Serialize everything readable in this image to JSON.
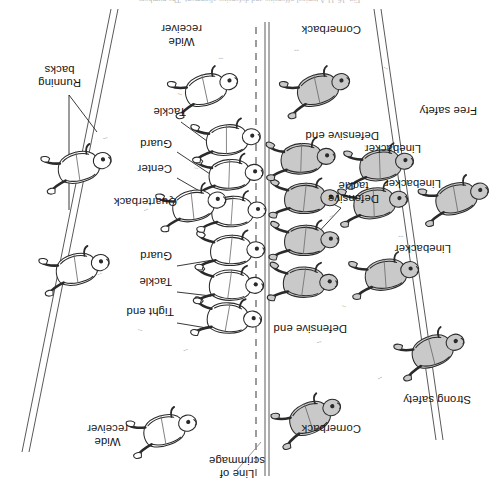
{
  "figure": {
    "caption": "Fig. 16-11  A typical offensive and defensive alignment. The numbers",
    "orientation_note": "printed upside-down (rotated 180 degrees)",
    "line_of_scrimmage_label": "Line of\nscrimmage"
  },
  "field": {
    "background_color": "#ffffff",
    "line_color": "#595959",
    "scrimmage_style": "dashed",
    "sideline_style": "double-solid-diagonal"
  },
  "colors": {
    "defense_fill": "#c9c9c9",
    "offense_fill": "#ffffff",
    "outline": "#2a2a2a",
    "leader_line": "#222222",
    "label_text": "#141414",
    "grass": "#9a9a9a"
  },
  "defense": {
    "side_label": "Defense",
    "labels": [
      {
        "id": "cornerback-top",
        "text": "Cornerback",
        "x": 138,
        "y": 65
      },
      {
        "id": "strong-safety",
        "text": "Strong safety",
        "x": 28,
        "y": 94
      },
      {
        "id": "defensive-end-up",
        "text": "Defensive end",
        "x": 152,
        "y": 165
      },
      {
        "id": "linebacker-1",
        "text": "Linebacker",
        "x": 48,
        "y": 245
      },
      {
        "id": "defensive-tackle",
        "text": "Defensive\ntackle",
        "x": 120,
        "y": 295
      },
      {
        "id": "linebacker-2",
        "text": "Linebacker",
        "x": 58,
        "y": 310
      },
      {
        "id": "linebacker-3",
        "text": "Linebacker",
        "x": 78,
        "y": 345
      },
      {
        "id": "defensive-end-dn",
        "text": "Defensive end",
        "x": 120,
        "y": 358
      },
      {
        "id": "free-safety",
        "text": "Free safety",
        "x": 22,
        "y": 383
      },
      {
        "id": "cornerback-bot",
        "text": "Cornerback",
        "x": 138,
        "y": 464
      }
    ],
    "players": [
      {
        "id": "cornerback-top",
        "x": 185,
        "y": 96,
        "rot": -22,
        "shaded": true
      },
      {
        "id": "strong-safety",
        "x": 63,
        "y": 160,
        "rot": -18,
        "shaded": true
      },
      {
        "id": "linebacker-outer",
        "x": 112,
        "y": 230,
        "rot": -8,
        "shaded": true
      },
      {
        "id": "defensive-end-1",
        "x": 198,
        "y": 215,
        "rot": 4,
        "shaded": true
      },
      {
        "id": "defensive-tackle-1",
        "x": 196,
        "y": 258,
        "rot": 2,
        "shaded": true
      },
      {
        "id": "defensive-tackle-2",
        "x": 196,
        "y": 300,
        "rot": 2,
        "shaded": true
      },
      {
        "id": "defensive-end-2",
        "x": 198,
        "y": 342,
        "rot": -2,
        "shaded": true
      },
      {
        "id": "linebacker-mid",
        "x": 124,
        "y": 300,
        "rot": -6,
        "shaded": true
      },
      {
        "id": "linebacker-low",
        "x": 118,
        "y": 338,
        "rot": -6,
        "shaded": true
      },
      {
        "id": "free-safety",
        "x": 40,
        "y": 310,
        "rot": -14,
        "shaded": true
      },
      {
        "id": "cornerback-bot",
        "x": 178,
        "y": 420,
        "rot": -16,
        "shaded": true
      }
    ]
  },
  "offense": {
    "side_label": "Offense",
    "labels": [
      {
        "id": "wide-receiver-top",
        "text": "Wide\nreceiver",
        "x": 371,
        "y": 52
      },
      {
        "id": "tight-end",
        "text": "Tight end",
        "x": 325,
        "y": 182
      },
      {
        "id": "tackle-top",
        "text": "Tackle",
        "x": 327,
        "y": 212
      },
      {
        "id": "guard-top",
        "text": "Guard",
        "x": 327,
        "y": 238
      },
      {
        "id": "quarterback",
        "text": "Quarterback",
        "x": 322,
        "y": 292
      },
      {
        "id": "center",
        "text": "Center",
        "x": 327,
        "y": 325
      },
      {
        "id": "guard-bot",
        "text": "Guard",
        "x": 327,
        "y": 350
      },
      {
        "id": "tackle-bot",
        "text": "Tackle",
        "x": 313,
        "y": 382
      },
      {
        "id": "running-backs",
        "text": "Running\nbacks",
        "x": 418,
        "y": 411
      },
      {
        "id": "wide-receiver-bot",
        "text": "Wide\nreceiver",
        "x": 297,
        "y": 452
      }
    ],
    "players": [
      {
        "id": "wide-receiver-top",
        "x": 332,
        "y": 78,
        "rot": -14,
        "shaded": false
      },
      {
        "id": "tight-end",
        "x": 275,
        "y": 178,
        "rot": 6,
        "shaded": false
      },
      {
        "id": "tackle-top",
        "x": 272,
        "y": 212,
        "rot": 4,
        "shaded": false
      },
      {
        "id": "guard-top",
        "x": 270,
        "y": 248,
        "rot": 2,
        "shaded": false
      },
      {
        "id": "center",
        "x": 268,
        "y": 288,
        "rot": 0,
        "shaded": false
      },
      {
        "id": "guard-bot",
        "x": 270,
        "y": 326,
        "rot": -2,
        "shaded": false
      },
      {
        "id": "tackle-bot",
        "x": 272,
        "y": 362,
        "rot": -4,
        "shaded": false
      },
      {
        "id": "quarterback",
        "x": 304,
        "y": 300,
        "rot": -10,
        "shaded": false
      },
      {
        "id": "running-back-1",
        "x": 420,
        "y": 238,
        "rot": -12,
        "shaded": false
      },
      {
        "id": "running-back-2",
        "x": 418,
        "y": 340,
        "rot": -12,
        "shaded": false
      },
      {
        "id": "wide-receiver-bot",
        "x": 290,
        "y": 420,
        "rot": -16,
        "shaded": false
      }
    ]
  },
  "leader_lines": [
    {
      "id": "scrimmage-leader",
      "x1": 262,
      "y1": 30,
      "x2": 238,
      "y2": 58
    },
    {
      "id": "tight-end-leader",
      "x1": 322,
      "y1": 177,
      "x2": 292,
      "y2": 172
    },
    {
      "id": "tackle-top-leader",
      "x1": 322,
      "y1": 208,
      "x2": 288,
      "y2": 204
    },
    {
      "id": "guard-top-leader",
      "x1": 322,
      "y1": 234,
      "x2": 286,
      "y2": 240
    },
    {
      "id": "center-leader",
      "x1": 322,
      "y1": 322,
      "x2": 284,
      "y2": 300
    },
    {
      "id": "guard-bot-leader",
      "x1": 322,
      "y1": 348,
      "x2": 286,
      "y2": 324
    },
    {
      "id": "tackle-bot-leader",
      "x1": 318,
      "y1": 378,
      "x2": 288,
      "y2": 356
    },
    {
      "id": "rb-leader-1",
      "x1": 430,
      "y1": 405,
      "x2": 430,
      "y2": 290
    },
    {
      "id": "rb-leader-2",
      "x1": 430,
      "y1": 405,
      "x2": 402,
      "y2": 368
    },
    {
      "id": "dtackle-leader-1",
      "x1": 158,
      "y1": 292,
      "x2": 186,
      "y2": 262
    },
    {
      "id": "dtackle-leader-2",
      "x1": 158,
      "y1": 292,
      "x2": 186,
      "y2": 306
    }
  ],
  "grass_tufts": [
    {
      "x": 118,
      "y": 120
    },
    {
      "x": 72,
      "y": 138
    },
    {
      "x": 178,
      "y": 156
    },
    {
      "x": 152,
      "y": 192
    },
    {
      "x": 96,
      "y": 262
    },
    {
      "x": 166,
      "y": 282
    },
    {
      "x": 130,
      "y": 352
    },
    {
      "x": 190,
      "y": 392
    },
    {
      "x": 110,
      "y": 430
    },
    {
      "x": 200,
      "y": 448
    },
    {
      "x": 312,
      "y": 148
    },
    {
      "x": 356,
      "y": 168
    },
    {
      "x": 330,
      "y": 238
    },
    {
      "x": 352,
      "y": 288
    },
    {
      "x": 300,
      "y": 330
    },
    {
      "x": 392,
      "y": 360
    },
    {
      "x": 316,
      "y": 404
    },
    {
      "x": 276,
      "y": 440
    },
    {
      "x": 398,
      "y": 224
    },
    {
      "x": 244,
      "y": 332
    }
  ]
}
